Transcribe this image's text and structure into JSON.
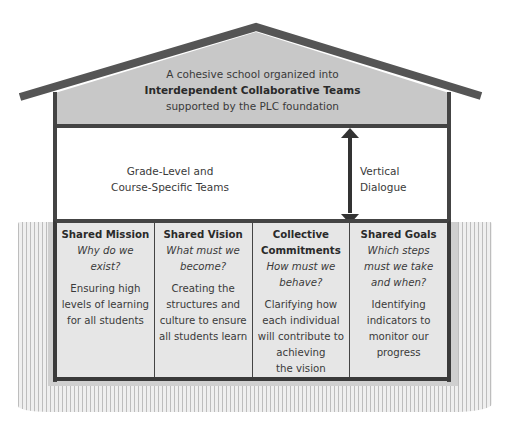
{
  "roof": {
    "line1": "A cohesive school organized into",
    "line2": "Interdependent Collaborative Teams",
    "line3": "supported by the PLC foundation"
  },
  "middle": {
    "left_line1": "Grade-Level and",
    "left_line2": "Course-Specific Teams",
    "right_line1": "Vertical",
    "right_line2": "Dialogue",
    "arrow": "double-vertical-arrow"
  },
  "pillars": [
    {
      "title": [
        "Shared Mission"
      ],
      "question": [
        "Why do we",
        "exist?"
      ],
      "description": [
        "Ensuring high",
        "levels of learning",
        "for all students"
      ]
    },
    {
      "title": [
        "Shared Vision"
      ],
      "question": [
        "What must we",
        "become?"
      ],
      "description": [
        "Creating the",
        "structures and",
        "culture to ensure",
        "all students learn"
      ]
    },
    {
      "title": [
        "Collective",
        "Commitments"
      ],
      "question": [
        "How must we",
        "behave?"
      ],
      "description": [
        "Clarifying how",
        "each individual",
        "will contribute to",
        "achieving",
        "the vision"
      ]
    },
    {
      "title": [
        "Shared Goals"
      ],
      "question": [
        "Which steps",
        "must we take",
        "and when?"
      ],
      "description": [
        "Identifying",
        "indicators to",
        "monitor our",
        "progress"
      ]
    }
  ],
  "colors": {
    "roof_fill": "#c8c8c8",
    "roof_edge": "#555555",
    "walls": "#444444",
    "pillar_fill": "#e6e6e6",
    "ground_stripes": "#bdbdbd"
  }
}
